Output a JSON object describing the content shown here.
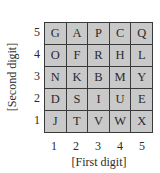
{
  "figure": {
    "x_axis_title": "[First digit]",
    "y_axis_title": "[Second digit]",
    "x_ticks": [
      "1",
      "2",
      "3",
      "4",
      "5"
    ],
    "y_ticks_top_to_bottom": [
      "5",
      "4",
      "3",
      "2",
      "1"
    ],
    "cell_color": "#c9c9c9",
    "border_color": "#3a3a3a",
    "rows_top_to_bottom": [
      [
        "G",
        "A",
        "P",
        "C",
        "Q"
      ],
      [
        "O",
        "F",
        "R",
        "H",
        "L"
      ],
      [
        "N",
        "K",
        "B",
        "M",
        "Y"
      ],
      [
        "D",
        "S",
        "I",
        "U",
        "E"
      ],
      [
        "J",
        "T",
        "V",
        "W",
        "X"
      ]
    ]
  }
}
